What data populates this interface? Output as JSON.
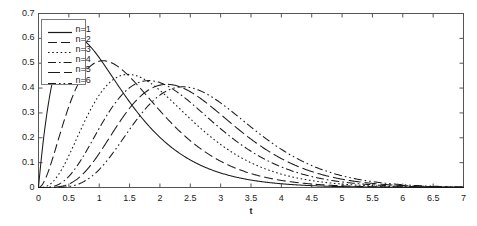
{
  "chart_data": {
    "type": "line",
    "title": "",
    "xlabel": "t",
    "ylabel": "",
    "xlim": [
      0,
      7
    ],
    "ylim": [
      0,
      0.7
    ],
    "grid": false,
    "legend_position": "upper-left",
    "x_ticks": [
      "0",
      "0.5",
      "1",
      "1.5",
      "2",
      "2.5",
      "3",
      "3.5",
      "4",
      "4.5",
      "5",
      "5.5",
      "6",
      "6.5",
      "7"
    ],
    "x_tick_values": [
      0,
      0.5,
      1,
      1.5,
      2,
      2.5,
      3,
      3.5,
      4,
      4.5,
      5,
      5.5,
      6,
      6.5,
      7
    ],
    "y_ticks": [
      "0",
      "0.1",
      "0.2",
      "0.3",
      "0.4",
      "0.5",
      "0.6",
      "0.7"
    ],
    "y_tick_values": [
      0,
      0.1,
      0.2,
      0.3,
      0.4,
      0.5,
      0.6,
      0.7
    ],
    "line_color": "#1a1a1a",
    "series": [
      {
        "name": "n=1",
        "dash": "solid",
        "shape": 2,
        "rate": 1.333,
        "peak_t": 1.5,
        "peak_y": 0.605,
        "x": [
          0,
          0.25,
          0.5,
          0.75,
          1,
          1.25,
          1.5,
          1.75,
          2,
          2.25,
          2.5,
          2.75,
          3,
          3.25,
          3.5,
          3.75,
          4,
          4.25,
          4.5,
          5,
          5.5,
          6,
          6.5,
          7
        ],
        "y": [
          0,
          0.318,
          0.456,
          0.528,
          0.561,
          0.589,
          0.605,
          0.593,
          0.569,
          0.535,
          0.495,
          0.453,
          0.41,
          0.368,
          0.328,
          0.29,
          0.255,
          0.223,
          0.194,
          0.143,
          0.103,
          0.073,
          0.051,
          0.035
        ]
      },
      {
        "name": "n=2",
        "dash": "longdash",
        "shape": 3,
        "rate": 1.364,
        "peak_t": 2.2,
        "peak_y": 0.51,
        "x": [
          0,
          0.25,
          0.5,
          0.75,
          1,
          1.25,
          1.5,
          1.75,
          2,
          2.25,
          2.5,
          2.75,
          3,
          3.25,
          3.5,
          3.75,
          4,
          4.25,
          4.5,
          5,
          5.5,
          6,
          6.5,
          7
        ],
        "y": [
          0,
          0.073,
          0.18,
          0.28,
          0.362,
          0.423,
          0.466,
          0.494,
          0.507,
          0.51,
          0.504,
          0.49,
          0.47,
          0.446,
          0.419,
          0.39,
          0.36,
          0.33,
          0.3,
          0.243,
          0.192,
          0.149,
          0.113,
          0.085
        ]
      },
      {
        "name": "n=3",
        "dash": "dotted",
        "shape": 4,
        "rate": 1.429,
        "peak_t": 2.8,
        "peak_y": 0.455,
        "x": [
          0,
          0.25,
          0.5,
          0.75,
          1,
          1.25,
          1.5,
          1.75,
          2,
          2.25,
          2.5,
          2.75,
          3,
          3.25,
          3.5,
          3.75,
          4,
          4.25,
          4.5,
          5,
          5.5,
          6,
          6.5,
          7
        ],
        "y": [
          0,
          0.016,
          0.057,
          0.114,
          0.178,
          0.242,
          0.301,
          0.353,
          0.396,
          0.428,
          0.449,
          0.46,
          0.462,
          0.456,
          0.444,
          0.427,
          0.406,
          0.382,
          0.357,
          0.303,
          0.249,
          0.199,
          0.156,
          0.12
        ]
      },
      {
        "name": "n=4",
        "dash": "dashdot",
        "shape": 5,
        "rate": 1.449,
        "peak_t": 3.35,
        "peak_y": 0.43,
        "x": [
          0,
          0.25,
          0.5,
          0.75,
          1,
          1.25,
          1.5,
          1.75,
          2,
          2.25,
          2.5,
          2.75,
          3,
          3.25,
          3.5,
          3.75,
          4,
          4.25,
          4.5,
          5,
          5.5,
          6,
          6.5,
          7
        ],
        "y": [
          0,
          0.004,
          0.019,
          0.046,
          0.086,
          0.135,
          0.19,
          0.245,
          0.298,
          0.345,
          0.385,
          0.415,
          0.435,
          0.446,
          0.448,
          0.443,
          0.431,
          0.414,
          0.393,
          0.345,
          0.293,
          0.241,
          0.194,
          0.153
        ]
      },
      {
        "name": "n=5",
        "dash": "longdash2",
        "shape": 6,
        "rate": 1.471,
        "peak_t": 3.85,
        "peak_y": 0.415,
        "x": [
          0,
          0.25,
          0.5,
          0.75,
          1,
          1.25,
          1.5,
          1.75,
          2,
          2.25,
          2.5,
          2.75,
          3,
          3.25,
          3.5,
          3.75,
          4,
          4.25,
          4.5,
          5,
          5.5,
          6,
          6.5,
          7
        ],
        "y": [
          0,
          0.001,
          0.006,
          0.018,
          0.039,
          0.07,
          0.11,
          0.157,
          0.208,
          0.259,
          0.308,
          0.352,
          0.389,
          0.417,
          0.436,
          0.447,
          0.449,
          0.445,
          0.434,
          0.399,
          0.351,
          0.299,
          0.247,
          0.199
        ]
      },
      {
        "name": "n=6",
        "dash": "dashdotdot",
        "shape": 7,
        "rate": 1.494,
        "peak_t": 4.35,
        "peak_y": 0.405,
        "x": [
          0,
          0.25,
          0.5,
          0.75,
          1,
          1.25,
          1.5,
          1.75,
          2,
          2.25,
          2.5,
          2.75,
          3,
          3.25,
          3.5,
          3.75,
          4,
          4.25,
          4.5,
          5,
          5.5,
          6,
          6.5,
          7
        ],
        "y": [
          0,
          0.0,
          0.002,
          0.007,
          0.017,
          0.034,
          0.06,
          0.093,
          0.134,
          0.18,
          0.228,
          0.277,
          0.323,
          0.364,
          0.398,
          0.424,
          0.442,
          0.452,
          0.454,
          0.436,
          0.398,
          0.348,
          0.294,
          0.241
        ]
      }
    ]
  },
  "legend": {
    "entries": [
      {
        "label": "n=1",
        "style": "solid"
      },
      {
        "label": "n=2",
        "style": "longdash"
      },
      {
        "label": "n=3",
        "style": "dotted"
      },
      {
        "label": "n=4",
        "style": "dashdot"
      },
      {
        "label": "n=5",
        "style": "longdash2"
      },
      {
        "label": "n=6",
        "style": "dashdotdot"
      }
    ]
  },
  "axes": {
    "x_axis_label": "t",
    "frame_color": "#555555"
  }
}
